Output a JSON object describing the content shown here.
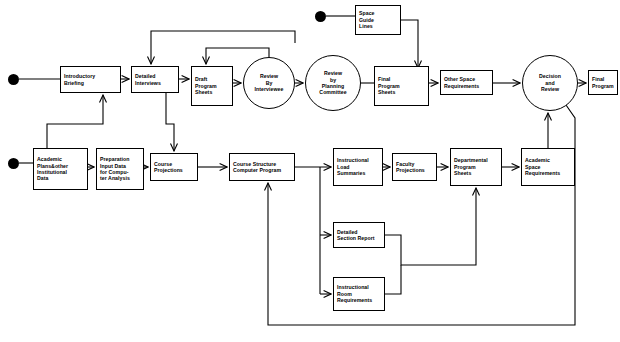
{
  "diagram": {
    "type": "flowchart",
    "canvas": {
      "width": 620,
      "height": 342
    },
    "stroke_color": "#000000",
    "background_color": "#ffffff",
    "nodes": [
      {
        "id": "introductory_briefing",
        "shape": "box",
        "lines": [
          "Introductory",
          "Briefing"
        ],
        "x": 60,
        "y": 66,
        "w": 61,
        "h": 27
      },
      {
        "id": "detailed_interviews",
        "shape": "box",
        "lines": [
          "Detailed",
          "Interviews"
        ],
        "x": 131,
        "y": 66,
        "w": 48,
        "h": 27
      },
      {
        "id": "draft_program_sheets",
        "shape": "box",
        "lines": [
          "Draft",
          "Program",
          "Sheets"
        ],
        "x": 191,
        "y": 66,
        "w": 42,
        "h": 40
      },
      {
        "id": "review_by_interviewee",
        "shape": "circle",
        "lines": [
          "Review",
          "By",
          "Interviewee"
        ],
        "x": 243,
        "y": 57,
        "w": 52,
        "h": 52
      },
      {
        "id": "review_by_planning_committee",
        "shape": "circle",
        "lines": [
          "Review",
          "by",
          "Planning",
          "Committee"
        ],
        "x": 305,
        "y": 55,
        "w": 56,
        "h": 56
      },
      {
        "id": "final_program_sheets",
        "shape": "box",
        "lines": [
          "Final",
          "Program",
          "Sheets"
        ],
        "x": 374,
        "y": 66,
        "w": 55,
        "h": 40
      },
      {
        "id": "other_space_requirements",
        "shape": "box",
        "lines": [
          "Other Space",
          "Requirements"
        ],
        "x": 440,
        "y": 70,
        "w": 53,
        "h": 25
      },
      {
        "id": "decision_and_review",
        "shape": "circle",
        "lines": [
          "Decision",
          "and",
          "Review"
        ],
        "x": 522,
        "y": 55,
        "w": 56,
        "h": 56
      },
      {
        "id": "final_program",
        "shape": "box",
        "lines": [
          "Final",
          "Program"
        ],
        "x": 588,
        "y": 70,
        "w": 30,
        "h": 25
      },
      {
        "id": "space_guide_lines",
        "shape": "box",
        "lines": [
          "Space",
          "Guide",
          "Lines"
        ],
        "x": 355,
        "y": 5,
        "w": 46,
        "h": 30
      },
      {
        "id": "academic_plans",
        "shape": "box",
        "lines": [
          "Academic",
          "Plans&other",
          "Institutional",
          "Data"
        ],
        "x": 33,
        "y": 148,
        "w": 55,
        "h": 42
      },
      {
        "id": "preparation_input_data",
        "shape": "box",
        "lines": [
          "Preparation",
          "Input Data",
          "for Compu-",
          "ter Analysis"
        ],
        "x": 96,
        "y": 148,
        "w": 48,
        "h": 42
      },
      {
        "id": "course_projections",
        "shape": "box",
        "lines": [
          "Course",
          "Projections"
        ],
        "x": 150,
        "y": 153,
        "w": 48,
        "h": 28
      },
      {
        "id": "course_structure_computer_program",
        "shape": "box",
        "lines": [
          "Course Structure",
          "Computer Program"
        ],
        "x": 229,
        "y": 153,
        "w": 66,
        "h": 28
      },
      {
        "id": "instructional_load_summaries",
        "shape": "box",
        "lines": [
          "Instructional",
          "Load",
          "Summaries"
        ],
        "x": 333,
        "y": 148,
        "w": 50,
        "h": 38
      },
      {
        "id": "faculty_projections",
        "shape": "box",
        "lines": [
          "Faculty",
          "Projections"
        ],
        "x": 392,
        "y": 153,
        "w": 45,
        "h": 28
      },
      {
        "id": "departmental_program_sheets",
        "shape": "box",
        "lines": [
          "Departmental",
          "Program",
          "Sheets"
        ],
        "x": 450,
        "y": 148,
        "w": 52,
        "h": 38
      },
      {
        "id": "academic_space_requirements",
        "shape": "box",
        "lines": [
          "Academic",
          "Space",
          "Requirements"
        ],
        "x": 521,
        "y": 148,
        "w": 54,
        "h": 38
      },
      {
        "id": "detailed_section_report",
        "shape": "box",
        "lines": [
          "Detailed",
          "Section Report"
        ],
        "x": 333,
        "y": 222,
        "w": 52,
        "h": 26
      },
      {
        "id": "instructional_room_requirements",
        "shape": "box",
        "lines": [
          "Instructional",
          "Room",
          "Requirements"
        ],
        "x": 333,
        "y": 277,
        "w": 52,
        "h": 34
      }
    ],
    "terminators": [
      {
        "id": "start_briefing",
        "x": 13,
        "y": 79,
        "r": 5.5
      },
      {
        "id": "start_academic_plans",
        "x": 13,
        "y": 163,
        "r": 5.5
      },
      {
        "id": "start_space_guide_lines",
        "x": 320,
        "y": 16,
        "r": 5.5
      }
    ],
    "edges": [
      {
        "id": "e-start-briefing",
        "from": "start_briefing",
        "to": "introductory_briefing"
      },
      {
        "id": "e-briefing-interviews",
        "from": "introductory_briefing",
        "to": "detailed_interviews"
      },
      {
        "id": "e-interviews-draft",
        "from": "detailed_interviews",
        "to": "draft_program_sheets"
      },
      {
        "id": "e-draft-review-interviewee",
        "from": "draft_program_sheets",
        "to": "review_by_interviewee"
      },
      {
        "id": "e-review-interviewee-review-planning",
        "from": "review_by_interviewee",
        "to": "review_by_planning_committee"
      },
      {
        "id": "e-review-interviewee-feedback",
        "from": "review_by_interviewee",
        "to": "draft_program_sheets"
      },
      {
        "id": "e-review-planning-feedback",
        "from": "review_by_planning_committee",
        "to": "draft_program_sheets"
      },
      {
        "id": "e-review-planning-final-sheets",
        "from": "review_by_planning_committee",
        "to": "final_program_sheets"
      },
      {
        "id": "e-final-sheets-other-space",
        "from": "final_program_sheets",
        "to": "other_space_requirements"
      },
      {
        "id": "e-guide-lines-other-space",
        "from": "space_guide_lines",
        "to": "other_space_requirements"
      },
      {
        "id": "e-start-guide-lines",
        "from": "start_space_guide_lines",
        "to": "space_guide_lines"
      },
      {
        "id": "e-other-space-decision",
        "from": "other_space_requirements",
        "to": "decision_and_review"
      },
      {
        "id": "e-decision-final-program",
        "from": "decision_and_review",
        "to": "final_program"
      },
      {
        "id": "e-start-academic-plans",
        "from": "start_academic_plans",
        "to": "academic_plans"
      },
      {
        "id": "e-academic-plans-prep",
        "from": "academic_plans",
        "to": "preparation_input_data"
      },
      {
        "id": "e-prep-course-projections",
        "from": "preparation_input_data",
        "to": "course_projections"
      },
      {
        "id": "e-academic-plans-interviews",
        "from": "academic_plans",
        "to": "detailed_interviews"
      },
      {
        "id": "e-interviews-course-projections",
        "from": "detailed_interviews",
        "to": "course_projections"
      },
      {
        "id": "e-course-projections-structure",
        "from": "course_projections",
        "to": "course_structure_computer_program"
      },
      {
        "id": "e-structure-load-summaries",
        "from": "course_structure_computer_program",
        "to": "instructional_load_summaries"
      },
      {
        "id": "e-structure-detailed-section",
        "from": "course_structure_computer_program",
        "to": "detailed_section_report"
      },
      {
        "id": "e-structure-room-requirements",
        "from": "course_structure_computer_program",
        "to": "instructional_room_requirements"
      },
      {
        "id": "e-load-summaries-faculty",
        "from": "instructional_load_summaries",
        "to": "faculty_projections"
      },
      {
        "id": "e-faculty-departmental",
        "from": "faculty_projections",
        "to": "departmental_program_sheets"
      },
      {
        "id": "e-departmental-academic-space",
        "from": "departmental_program_sheets",
        "to": "academic_space_requirements"
      },
      {
        "id": "e-detailed-section-departmental",
        "from": "detailed_section_report",
        "to": "departmental_program_sheets"
      },
      {
        "id": "e-room-requirements-departmental",
        "from": "instructional_room_requirements",
        "to": "departmental_program_sheets"
      },
      {
        "id": "e-academic-space-decision",
        "from": "academic_space_requirements",
        "to": "decision_and_review"
      },
      {
        "id": "e-decision-feedback-structure",
        "from": "decision_and_review",
        "to": "course_structure_computer_program"
      }
    ]
  }
}
